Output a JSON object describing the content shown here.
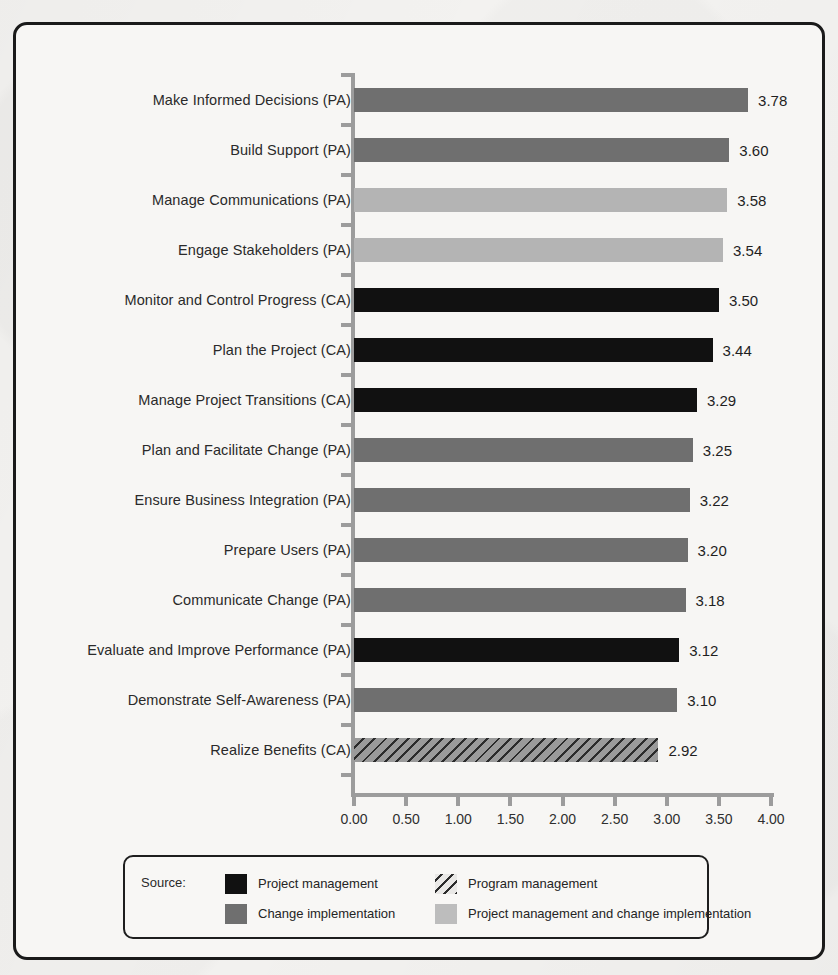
{
  "figure": {
    "frame_border_color": "#1a1a1a",
    "background_color": "#f7f6f4"
  },
  "legend": {
    "source_label": "Source:",
    "items": [
      {
        "key": "project",
        "label": "Project management",
        "color": "#111111",
        "pattern": "solid"
      },
      {
        "key": "program",
        "label": "Program management",
        "color": "#9a9a9a",
        "pattern": "diagonal-hatch"
      },
      {
        "key": "change",
        "label": "Change implementation",
        "color": "#6f6f6f",
        "pattern": "solid"
      },
      {
        "key": "both",
        "label": "Project management and change implementation",
        "color": "#bdbdbd",
        "pattern": "solid"
      }
    ]
  },
  "chart_data": {
    "type": "bar",
    "orientation": "horizontal",
    "title": "",
    "subtitle": "",
    "xlabel": "",
    "ylabel": "",
    "xlim": [
      0.0,
      4.0
    ],
    "xticks": [
      0.0,
      0.5,
      1.0,
      1.5,
      2.0,
      2.5,
      3.0,
      3.5,
      4.0
    ],
    "xtick_labels": [
      "0.00",
      "0.50",
      "1.00",
      "1.50",
      "2.00",
      "2.50",
      "3.00",
      "3.50",
      "4.00"
    ],
    "grid": false,
    "legend_position": "bottom",
    "value_label_format": "0.00",
    "categories": [
      "Make Informed Decisions (PA)",
      "Build Support (PA)",
      "Manage Communications (PA)",
      "Engage Stakeholders (PA)",
      "Monitor and Control Progress (CA)",
      "Plan the Project (CA)",
      "Manage Project Transitions (CA)",
      "Plan and Facilitate Change (PA)",
      "Ensure Business Integration (PA)",
      "Prepare Users (PA)",
      "Communicate Change (PA)",
      "Evaluate and Improve Performance (PA)",
      "Demonstrate Self-Awareness (PA)",
      "Realize Benefits (CA)"
    ],
    "values": [
      3.78,
      3.6,
      3.58,
      3.54,
      3.5,
      3.44,
      3.29,
      3.25,
      3.22,
      3.2,
      3.18,
      3.12,
      3.1,
      2.92
    ],
    "value_labels": [
      "3.78",
      "3.60",
      "3.58",
      "3.54",
      "3.50",
      "3.44",
      "3.29",
      "3.25",
      "3.22",
      "3.20",
      "3.18",
      "3.12",
      "3.10",
      "2.92"
    ],
    "source_keys": [
      "change",
      "change",
      "both",
      "both",
      "project",
      "project",
      "project",
      "change",
      "change",
      "change",
      "change",
      "project",
      "change",
      "program"
    ],
    "bars": [
      {
        "category": "Make Informed Decisions (PA)",
        "value": 3.78,
        "label": "3.78",
        "source": "change"
      },
      {
        "category": "Build Support (PA)",
        "value": 3.6,
        "label": "3.60",
        "source": "change"
      },
      {
        "category": "Manage Communications (PA)",
        "value": 3.58,
        "label": "3.58",
        "source": "both"
      },
      {
        "category": "Engage Stakeholders (PA)",
        "value": 3.54,
        "label": "3.54",
        "source": "both"
      },
      {
        "category": "Monitor and Control Progress (CA)",
        "value": 3.5,
        "label": "3.50",
        "source": "project"
      },
      {
        "category": "Plan the Project (CA)",
        "value": 3.44,
        "label": "3.44",
        "source": "project"
      },
      {
        "category": "Manage Project Transitions (CA)",
        "value": 3.29,
        "label": "3.29",
        "source": "project"
      },
      {
        "category": "Plan and Facilitate Change (PA)",
        "value": 3.25,
        "label": "3.25",
        "source": "change"
      },
      {
        "category": "Ensure Business Integration (PA)",
        "value": 3.22,
        "label": "3.22",
        "source": "change"
      },
      {
        "category": "Prepare Users (PA)",
        "value": 3.2,
        "label": "3.20",
        "source": "change"
      },
      {
        "category": "Communicate Change (PA)",
        "value": 3.18,
        "label": "3.18",
        "source": "change"
      },
      {
        "category": "Evaluate and Improve Performance (PA)",
        "value": 3.12,
        "label": "3.12",
        "source": "project"
      },
      {
        "category": "Demonstrate Self-Awareness (PA)",
        "value": 3.1,
        "label": "3.10",
        "source": "change"
      },
      {
        "category": "Realize Benefits (CA)",
        "value": 2.92,
        "label": "2.92",
        "source": "program"
      }
    ]
  }
}
